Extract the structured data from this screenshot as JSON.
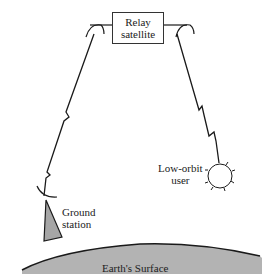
{
  "diagram": {
    "satellite": {
      "line1": "Relay",
      "line2": "satellite"
    },
    "ground_station": {
      "line1": "Ground",
      "line2": "station"
    },
    "low_orbit_user": {
      "line1": "Low-orbit",
      "line2": "user"
    },
    "surface_label": "Earth's Surface"
  },
  "colors": {
    "stroke": "#1a1a1a",
    "earth_fill": "#b3b3b3",
    "station_fill": "#a6a6a6",
    "background": "#ffffff"
  }
}
